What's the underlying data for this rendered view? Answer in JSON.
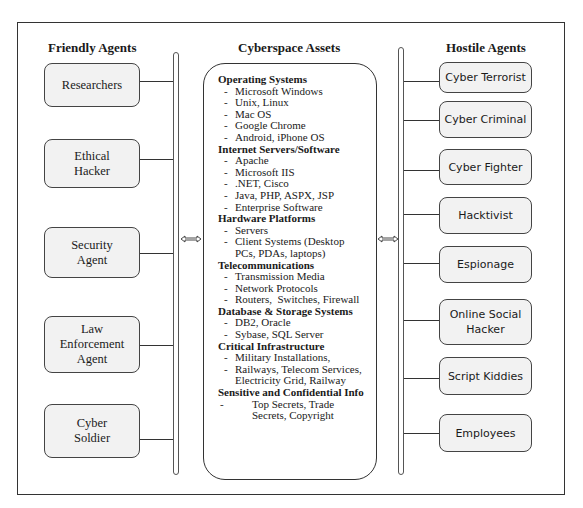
{
  "diagram": {
    "friendly": {
      "title": "Friendly Agents",
      "agents": [
        {
          "label": "Researchers"
        },
        {
          "label": "Ethical Hacker"
        },
        {
          "label": "Security Agent"
        },
        {
          "label": "Law Enforcement Agent"
        },
        {
          "label": "Cyber Soldier"
        }
      ]
    },
    "assets": {
      "title": "Cyberspace Assets",
      "categories": [
        {
          "title": "Operating Systems",
          "items": [
            "Microsoft Windows",
            "Unix, Linux",
            "Mac OS",
            "Google Chrome",
            "Android, iPhone OS"
          ]
        },
        {
          "title": "Internet Servers/Software",
          "items": [
            "Apache",
            "Microsoft IIS",
            ".NET, Cisco",
            "Java, PHP, ASPX, JSP",
            "Enterprise Software"
          ]
        },
        {
          "title": "Hardware Platforms",
          "items": [
            "Servers",
            "Client Systems (Desktop PCs, PDAs, laptops)"
          ]
        },
        {
          "title": "Telecommunications",
          "items": [
            "Transmission Media",
            "Network Protocols",
            "Routers,  Switches, Firewall"
          ]
        },
        {
          "title": "Database & Storage Systems",
          "items": [
            "DB2, Oracle",
            "Sybase, SQL Server"
          ]
        },
        {
          "title": "Critical Infrastructure",
          "items": [
            "Military Installations,",
            "Railways, Telecom Services, Electricity Grid, Railway"
          ]
        },
        {
          "title": "Sensitive and Confidential Info",
          "items": [
            "Top Secrets, Trade Secrets, Copyright"
          ]
        }
      ]
    },
    "hostile": {
      "title": "Hostile Agents",
      "agents": [
        {
          "label": "Cyber Terrorist"
        },
        {
          "label": "Cyber Criminal"
        },
        {
          "label": "Cyber Fighter"
        },
        {
          "label": "Hacktivist"
        },
        {
          "label": "Espionage"
        },
        {
          "label": "Online Social Hacker"
        },
        {
          "label": "Script Kiddies"
        },
        {
          "label": "Employees"
        }
      ]
    },
    "arrows": [
      {
        "icon": "double-arrow-icon",
        "position": "between-friendly-and-assets"
      },
      {
        "icon": "double-arrow-icon",
        "position": "between-assets-and-hostile"
      }
    ],
    "colors": {
      "box_fill": "#f2f2f2",
      "border": "#333333",
      "background": "#ffffff"
    }
  }
}
